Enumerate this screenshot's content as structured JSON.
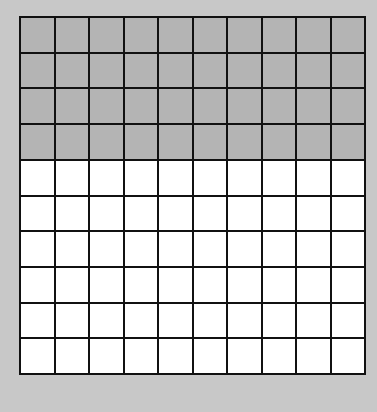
{
  "grid": {
    "rows": 10,
    "cols": 10,
    "shaded_rows": 4,
    "shaded_cells": 40,
    "total_cells": 100,
    "shaded_color": "#b4b4b4",
    "unshaded_color": "#ffffff",
    "background_color": "#c8c8c8"
  }
}
